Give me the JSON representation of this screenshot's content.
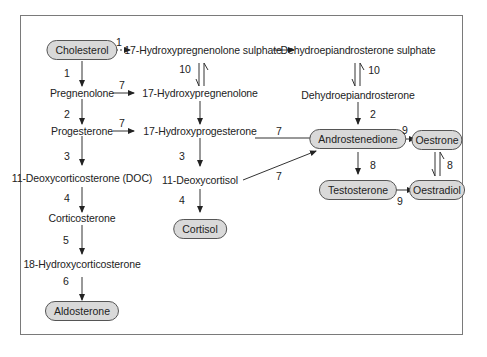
{
  "diagram": {
    "type": "steroid-biosynthesis-pathway",
    "nodes": {
      "cholesterol": "Cholesterol",
      "pregnenolone": "Pregnenolone",
      "progesterone": "Progesterone",
      "doc": "11-Deoxycorticosterone (DOC)",
      "corticosterone": "Corticosterone",
      "hydroxycorticosterone18": "18-Hydroxycorticosterone",
      "aldosterone": "Aldosterone",
      "hp_sulphate": "17-Hydroxypregnenolone sulphate",
      "hp": "17-Hydroxypregnenolone",
      "hprog": "17-Hydroxyprogesterone",
      "deoxycortisol": "11-Deoxycortisol",
      "cortisol": "Cortisol",
      "dhea_sulphate": "Dehydroepiandrosterone sulphate",
      "dhea": "Dehydroepiandrosterone",
      "androstenedione": "Androstenedione",
      "testosterone": "Testosterone",
      "oestrone": "Oestrone",
      "oestradiol": "Oestradiol"
    },
    "edge_labels": {
      "chol_to_hps": "1",
      "chol_to_preg": "1",
      "preg_to_hp": "7",
      "preg_to_prog": "2",
      "prog_to_hprog": "7",
      "prog_to_doc": "3",
      "doc_to_cort": "4",
      "cort_to_18oh": "5",
      "18oh_to_aldo": "6",
      "hps_hp": "10",
      "hprog_to_deoxy": "3",
      "deoxy_to_cortisol": "4",
      "hprog_to_andro": "7",
      "deoxy_to_andro": "7",
      "dheas_dhea": "10",
      "dhea_to_andro": "2",
      "andro_to_oestrone": "9",
      "andro_to_testo": "8",
      "testo_to_oestradiol": "9",
      "oestrone_oestradiol": "8"
    }
  }
}
